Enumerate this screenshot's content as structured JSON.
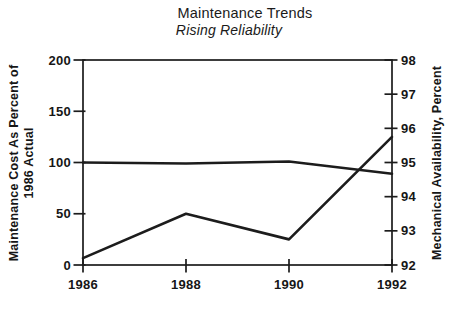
{
  "page": {
    "title": "Maintenance Trends",
    "subtitle": "Rising Reliability"
  },
  "chart_data": {
    "type": "line",
    "title": "Maintenance Trends",
    "subtitle": "Rising Reliability",
    "x": [
      1986,
      1988,
      1990,
      1992
    ],
    "x_tick_labels": [
      "1986",
      "1988",
      "1990",
      "1992"
    ],
    "series": [
      {
        "name": "Maintenance Cost As Percent of 1986 Actual",
        "axis": "left",
        "values": [
          100,
          99,
          101,
          89
        ]
      },
      {
        "name": "Mechanical Availability, Percent",
        "axis": "right",
        "values": [
          92.2,
          93.5,
          92.75,
          95.75
        ]
      }
    ],
    "left_axis": {
      "label_line1": "Maintenance Cost As Percent of",
      "label_line2": "1986 Actual",
      "ticks": [
        0,
        50,
        100,
        150,
        200
      ],
      "range": [
        0,
        200
      ]
    },
    "right_axis": {
      "label": "Mechanical Availability, Percent",
      "ticks": [
        92,
        93,
        94,
        95,
        96,
        97,
        98
      ],
      "range": [
        92,
        98
      ]
    },
    "grid": false,
    "legend": "none",
    "frame": true,
    "line_color": "#1c1c1c",
    "text_color": "#161616",
    "background": "#ffffff"
  }
}
